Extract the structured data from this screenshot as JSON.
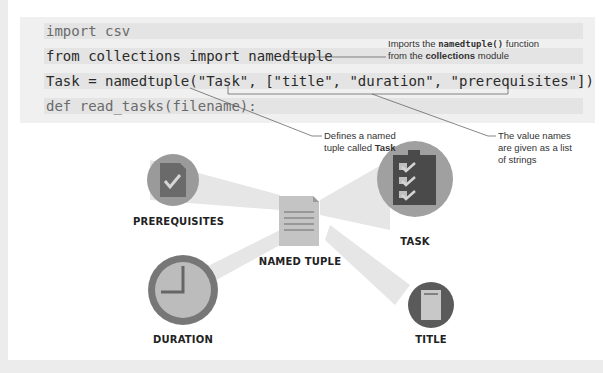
{
  "code": {
    "lines": [
      "import csv",
      "from collections import namedtuple",
      "Task = namedtuple(\"Task\", [\"title\", \"duration\", \"prerequisites\"])",
      "def read_tasks(filename):"
    ]
  },
  "annotations": {
    "imports": {
      "pre": "Imports the ",
      "code": "namedtuple()",
      "mid": " function",
      "line2_pre": "from the ",
      "bold": "collections",
      "line2_post": " module"
    },
    "defines": {
      "line1": "Defines a named",
      "line2_pre": "tuple called ",
      "bold": "Task"
    },
    "values": {
      "line1": "The value names",
      "line2": "are given as a list",
      "line3": "of strings"
    }
  },
  "diagram": {
    "center": "NAMED TUPLE",
    "nodes": {
      "prerequisites": "PREREQUISITES",
      "task": "TASK",
      "duration": "DURATION",
      "title": "TITLE"
    },
    "colors": {
      "dark": "#5a5a5a",
      "mid": "#8a8a8a",
      "light": "#bdbdbd",
      "paper": "#c8c8c8"
    }
  }
}
